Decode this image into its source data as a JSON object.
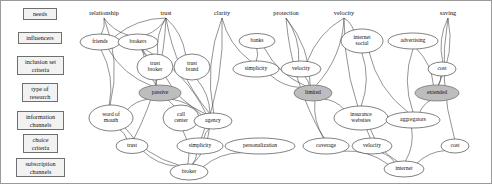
{
  "diagram": {
    "colors": {
      "edge": "#3a3a3a",
      "node_fill": "#ffffff",
      "node_stroke": "#2b2b2b",
      "shaded_fill": "#bdbdbd",
      "box_fill": "#f2f2f2",
      "border": "#9a9a9a"
    }
  },
  "side_boxes": [
    {
      "label": "needs",
      "x": 22,
      "y": 7,
      "w": 34,
      "h": 12
    },
    {
      "label": "influencers",
      "x": 17,
      "y": 31,
      "w": 44,
      "h": 12
    },
    {
      "label": "inclusion set\ncriteria",
      "x": 16,
      "y": 55,
      "w": 47,
      "h": 19
    },
    {
      "label": "type of\nresearch",
      "x": 21,
      "y": 82,
      "w": 36,
      "h": 19
    },
    {
      "label": "information\nchannels",
      "x": 16,
      "y": 110,
      "w": 47,
      "h": 19
    },
    {
      "label": "choice\ncriteria",
      "x": 22,
      "y": 133,
      "w": 35,
      "h": 19
    },
    {
      "label": "subscription\nchannels",
      "x": 15,
      "y": 157,
      "w": 49,
      "h": 19
    }
  ],
  "column_labels": [
    {
      "label": "relationship",
      "x": 103,
      "y": 14
    },
    {
      "label": "trust",
      "x": 165,
      "y": 14
    },
    {
      "label": "clarity",
      "x": 221,
      "y": 14
    },
    {
      "label": "protection",
      "x": 285,
      "y": 14
    },
    {
      "label": "velocity",
      "x": 343,
      "y": 14
    },
    {
      "label": "saving",
      "x": 447,
      "y": 14
    }
  ],
  "nodes": [
    {
      "id": "friends",
      "label": "friends",
      "x": 99,
      "y": 41,
      "rx": 20,
      "ry": 8,
      "shaded": false
    },
    {
      "id": "brokers",
      "label": "brokers",
      "x": 137,
      "y": 41,
      "rx": 20,
      "ry": 8,
      "shaded": false
    },
    {
      "id": "banks",
      "label": "banks",
      "x": 256,
      "y": 40,
      "rx": 18,
      "ry": 7.5,
      "shaded": false
    },
    {
      "id": "internet-social",
      "label": "internet\nsocial",
      "x": 361,
      "y": 40,
      "rx": 21,
      "ry": 12,
      "shaded": false
    },
    {
      "id": "advertising",
      "label": "advertising",
      "x": 412,
      "y": 40,
      "rx": 25,
      "ry": 8,
      "shaded": false
    },
    {
      "id": "trust-broker",
      "label": "trust\nbroker",
      "x": 154,
      "y": 66,
      "rx": 18,
      "ry": 13,
      "shaded": false
    },
    {
      "id": "trust-brand",
      "label": "trust\nbrand",
      "x": 191,
      "y": 66,
      "rx": 18,
      "ry": 13,
      "shaded": false
    },
    {
      "id": "simplicity-top",
      "label": "simplicity",
      "x": 255,
      "y": 68,
      "rx": 23,
      "ry": 8,
      "shaded": false
    },
    {
      "id": "velocity-top",
      "label": "velocity",
      "x": 300,
      "y": 68,
      "rx": 20,
      "ry": 8,
      "shaded": false
    },
    {
      "id": "cost-top",
      "label": "cost",
      "x": 441,
      "y": 68,
      "rx": 14,
      "ry": 7,
      "shaded": false
    },
    {
      "id": "passive",
      "label": "passive",
      "x": 159,
      "y": 92,
      "rx": 21,
      "ry": 8,
      "shaded": true
    },
    {
      "id": "limited",
      "label": "limited",
      "x": 312,
      "y": 92,
      "rx": 19,
      "ry": 8,
      "shaded": true
    },
    {
      "id": "extended",
      "label": "extended",
      "x": 436,
      "y": 92,
      "rx": 22,
      "ry": 8,
      "shaded": true
    },
    {
      "id": "word-of-mouth",
      "label": "word of\nmouth",
      "x": 110,
      "y": 117,
      "rx": 22,
      "ry": 13,
      "shaded": false
    },
    {
      "id": "call-center",
      "label": "call\ncenter",
      "x": 180,
      "y": 117,
      "rx": 18,
      "ry": 13,
      "shaded": false
    },
    {
      "id": "agency",
      "label": "agency",
      "x": 212,
      "y": 120,
      "rx": 19,
      "ry": 8,
      "shaded": false
    },
    {
      "id": "insurance-websites",
      "label": "insurance\nwebsites",
      "x": 360,
      "y": 117,
      "rx": 27,
      "ry": 12,
      "shaded": false
    },
    {
      "id": "aggregators",
      "label": "aggregators",
      "x": 412,
      "y": 119,
      "rx": 27,
      "ry": 8,
      "shaded": false
    },
    {
      "id": "trust-bottom",
      "label": "trust",
      "x": 131,
      "y": 145,
      "rx": 16,
      "ry": 7.5,
      "shaded": false
    },
    {
      "id": "simplicity-bottom",
      "label": "simplicity",
      "x": 199,
      "y": 145,
      "rx": 23,
      "ry": 8,
      "shaded": false
    },
    {
      "id": "personalization",
      "label": "personalization",
      "x": 259,
      "y": 145,
      "rx": 35,
      "ry": 8,
      "shaded": false
    },
    {
      "id": "coverage",
      "label": "coverage",
      "x": 325,
      "y": 145,
      "rx": 23,
      "ry": 8,
      "shaded": false
    },
    {
      "id": "velocity-bottom",
      "label": "velocity",
      "x": 371,
      "y": 145,
      "rx": 20,
      "ry": 8,
      "shaded": false
    },
    {
      "id": "cost-bottom",
      "label": "cost",
      "x": 454,
      "y": 145,
      "rx": 14,
      "ry": 7,
      "shaded": false
    },
    {
      "id": "broker",
      "label": "broker",
      "x": 188,
      "y": 171,
      "rx": 19,
      "ry": 8,
      "shaded": false
    },
    {
      "id": "internet",
      "label": "internet",
      "x": 403,
      "y": 168,
      "rx": 20,
      "ry": 8,
      "shaded": false
    }
  ],
  "edges": [
    {
      "from": "relationship-label",
      "to": "friends"
    },
    {
      "from": "relationship-label",
      "to": "brokers"
    },
    {
      "from": "relationship-label",
      "to": "word-of-mouth"
    },
    {
      "from": "trust-label",
      "to": "friends"
    },
    {
      "from": "trust-label",
      "to": "brokers"
    },
    {
      "from": "trust-label",
      "to": "trust-broker"
    },
    {
      "from": "trust-label",
      "to": "trust-brand"
    },
    {
      "from": "trust-label",
      "to": "agency"
    },
    {
      "from": "trust-label",
      "to": "trust-bottom"
    },
    {
      "from": "clarity-label",
      "to": "simplicity-top"
    },
    {
      "from": "clarity-label",
      "to": "simplicity-bottom"
    },
    {
      "from": "clarity-label",
      "to": "agency"
    },
    {
      "from": "protection-label",
      "to": "velocity-top"
    },
    {
      "from": "protection-label",
      "to": "coverage"
    },
    {
      "from": "protection-label",
      "to": "limited"
    },
    {
      "from": "velocity-label",
      "to": "velocity-top"
    },
    {
      "from": "velocity-label",
      "to": "limited"
    },
    {
      "from": "velocity-label",
      "to": "velocity-bottom"
    },
    {
      "from": "velocity-label",
      "to": "internet-social"
    },
    {
      "from": "saving-label",
      "to": "cost-top"
    },
    {
      "from": "saving-label",
      "to": "extended"
    },
    {
      "from": "saving-label",
      "to": "cost-bottom"
    },
    {
      "from": "friends",
      "to": "word-of-mouth"
    },
    {
      "from": "friends",
      "to": "passive"
    },
    {
      "from": "brokers",
      "to": "passive"
    },
    {
      "from": "brokers",
      "to": "trust-broker"
    },
    {
      "from": "brokers",
      "to": "agency"
    },
    {
      "from": "brokers",
      "to": "call-center"
    },
    {
      "from": "banks",
      "to": "simplicity-top"
    },
    {
      "from": "banks",
      "to": "limited"
    },
    {
      "from": "internet-social",
      "to": "insurance-websites"
    },
    {
      "from": "internet-social",
      "to": "aggregators"
    },
    {
      "from": "advertising",
      "to": "extended"
    },
    {
      "from": "advertising",
      "to": "aggregators"
    },
    {
      "from": "cost-top",
      "to": "extended"
    },
    {
      "from": "trust-broker",
      "to": "agency"
    },
    {
      "from": "trust-brand",
      "to": "agency"
    },
    {
      "from": "simplicity-top",
      "to": "limited"
    },
    {
      "from": "velocity-top",
      "to": "limited"
    },
    {
      "from": "passive",
      "to": "word-of-mouth"
    },
    {
      "from": "passive",
      "to": "agency"
    },
    {
      "from": "limited",
      "to": "coverage"
    },
    {
      "from": "limited",
      "to": "insurance-websites"
    },
    {
      "from": "extended",
      "to": "aggregators"
    },
    {
      "from": "word-of-mouth",
      "to": "trust-bottom"
    },
    {
      "from": "word-of-mouth",
      "to": "broker"
    },
    {
      "from": "call-center",
      "to": "broker"
    },
    {
      "from": "agency",
      "to": "simplicity-bottom"
    },
    {
      "from": "agency",
      "to": "broker"
    },
    {
      "from": "insurance-websites",
      "to": "internet"
    },
    {
      "from": "aggregators",
      "to": "internet"
    },
    {
      "from": "trust-bottom",
      "to": "broker"
    },
    {
      "from": "simplicity-bottom",
      "to": "broker"
    },
    {
      "from": "personalization",
      "to": "broker"
    },
    {
      "from": "velocity-bottom",
      "to": "internet"
    },
    {
      "from": "cost-bottom",
      "to": "internet"
    },
    {
      "from": "coverage",
      "to": "internet"
    }
  ]
}
